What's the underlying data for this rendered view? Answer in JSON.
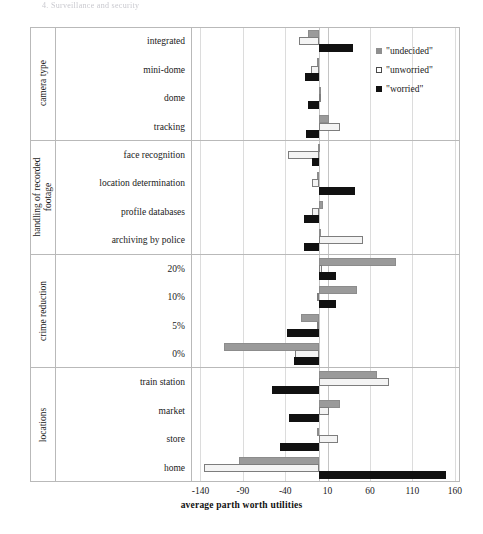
{
  "page_header": "4. Surveillance and security",
  "chart_data": {
    "type": "bar",
    "orientation": "horizontal",
    "title": "",
    "xlabel": "average parth worth utilities",
    "ylabel": "",
    "xlim": [
      -150,
      165
    ],
    "xticks": [
      -140,
      -90,
      -40,
      10,
      60,
      110,
      160
    ],
    "grid": true,
    "legend_position": "right-top",
    "legend": [
      "\"undecided\"",
      "\"unworried\"",
      "\"worried\""
    ],
    "series": [
      {
        "name": "\"undecided\"",
        "color": "#9a9a9a"
      },
      {
        "name": "\"unworried\"",
        "color": "#f4f4f4"
      },
      {
        "name": "\"worried\"",
        "color": "#111111"
      }
    ],
    "groups": [
      {
        "group_label": "camera type",
        "categories": [
          "integrated",
          "mini-dome",
          "dome",
          "tracking"
        ],
        "values": {
          "\"undecided\"": [
            -13,
            -2,
            1,
            12
          ],
          "\"unworried\"": [
            -24,
            -10,
            2,
            25
          ],
          "\"worried\"": [
            40,
            -17,
            -13,
            -16
          ]
        }
      },
      {
        "group_label": "handling of recorded footage",
        "categories": [
          "face recognition",
          "location determination",
          "profile databases",
          "archiving by police"
        ],
        "values": {
          "\"undecided\"": [
            -1,
            -3,
            4,
            0
          ],
          "\"unworried\"": [
            -37,
            -8,
            -8,
            52
          ],
          "\"worried\"": [
            -8,
            42,
            -18,
            -18
          ]
        }
      },
      {
        "group_label": "crime reduction",
        "categories": [
          "20%",
          "10%",
          "5%",
          "0%"
        ],
        "values": {
          "\"undecided\"": [
            91,
            45,
            -21,
            -112
          ],
          "\"unworried\"": [
            3,
            -2,
            -3,
            -29
          ],
          "\"worried\"": [
            20,
            20,
            -38,
            -30
          ]
        }
      },
      {
        "group_label": "locations",
        "categories": [
          "train station",
          "market",
          "store",
          "home"
        ],
        "values": {
          "\"undecided\"": [
            68,
            25,
            -2,
            -94
          ],
          "\"unworried\"": [
            82,
            12,
            22,
            -136
          ],
          "\"worried\"": [
            -56,
            -35,
            -46,
            150
          ]
        }
      }
    ]
  }
}
